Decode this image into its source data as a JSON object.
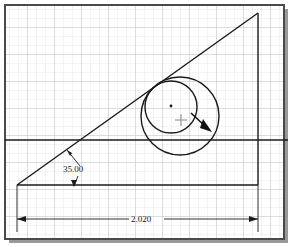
{
  "app": {
    "title": "CAD Sketch Canvas",
    "background_color": "#ffffff",
    "frame_border_color": "#4a4a4a",
    "frame_shadow_color": "#9a9a9a"
  },
  "grid": {
    "minor_spacing": 9,
    "major_spacing": 27,
    "minor_color": "#e8e6ea",
    "major_color": "#c9c6cc",
    "visible": true
  },
  "geometry": {
    "line_color": "#1a1a1a",
    "entities": [
      {
        "name": "inclined-line",
        "type": "line",
        "x1": 17,
        "y1": 185,
        "x2": 258,
        "y2": 13
      },
      {
        "name": "vertical-line",
        "type": "line",
        "x1": 258,
        "y1": 13,
        "x2": 258,
        "y2": 185
      },
      {
        "name": "base-line",
        "type": "line",
        "x1": 17,
        "y1": 185,
        "x2": 258,
        "y2": 185
      },
      {
        "name": "horizontal-reference-line",
        "type": "line",
        "x1": 5,
        "y1": 140,
        "x2": 288,
        "y2": 140
      },
      {
        "name": "inner-circle",
        "type": "circle",
        "cx": 171,
        "cy": 107,
        "r": 26
      },
      {
        "name": "outer-circle",
        "type": "circle",
        "cx": 180,
        "cy": 116,
        "r": 39
      },
      {
        "name": "circle-center-point",
        "type": "point",
        "cx": 171,
        "cy": 106
      }
    ]
  },
  "dimensions": {
    "angular": {
      "label": "35.00",
      "text_x": 63,
      "text_y": 170,
      "vertex_x": 17,
      "vertex_y": 185,
      "leader_upper": {
        "x1": 80,
        "y1": 168,
        "x2": 67,
        "y2": 150
      },
      "leader_lower": {
        "x1": 80,
        "y1": 176,
        "x2": 74,
        "y2": 187
      }
    },
    "linear": {
      "label": "2.020",
      "text_x": 132,
      "text_y": 222,
      "line_y": 219,
      "x_start": 17,
      "x_end": 258,
      "ext_left_x": 17,
      "ext_right_x": 258,
      "ext_top_y": 185,
      "ext_bottom_y": 232
    }
  },
  "cursor": {
    "snap_marker": {
      "name": "snap-crosshair",
      "x": 181,
      "y": 120,
      "color": "#999999",
      "size": 6
    },
    "drag_arrow": {
      "name": "drag-direction-arrow",
      "x1": 191,
      "y1": 113,
      "x2": 211,
      "y2": 131,
      "color": "#111111"
    }
  }
}
